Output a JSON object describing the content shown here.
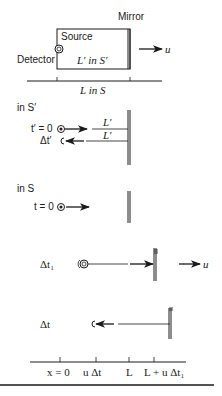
{
  "panel_setup": {
    "mirror_label": "Mirror",
    "source_label": "Source",
    "detector_label": "Detector",
    "box_length_label": "L′ in S′",
    "ground_length_label": "L in S",
    "velocity_label": "u"
  },
  "panel_S_prime": {
    "frame_label": "in S′",
    "start_label": "t′ = 0",
    "outgoing_length_label": "L′",
    "return_length_label": "L′",
    "return_time_label": "Δt′"
  },
  "panel_S": {
    "frame_label": "in S",
    "start_label": "t = 0"
  },
  "panel_dt1": {
    "time_label": "Δt₁",
    "velocity_label": "u"
  },
  "panel_dt": {
    "time_label": "Δt"
  },
  "axis": {
    "ticks": [
      "x = 0",
      "u Δt",
      "L",
      "L + u Δt₁"
    ]
  },
  "colors": {
    "ink": "#1a1a1a",
    "background": "#ffffff"
  }
}
